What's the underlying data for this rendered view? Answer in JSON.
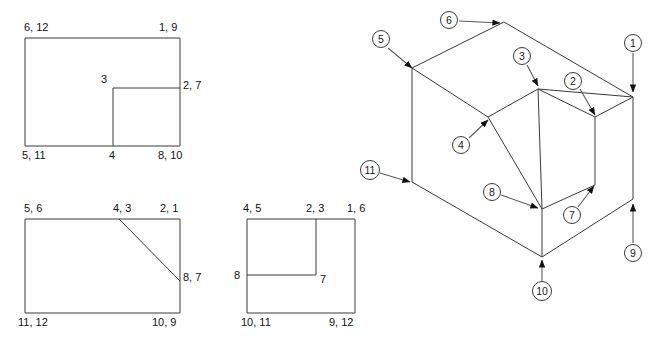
{
  "figure": {
    "type": "engineering-drawing",
    "stroke_color": "#1a1a1a",
    "background": "#ffffff"
  },
  "views": {
    "top_view": {
      "name": "top-view",
      "labels": [
        {
          "id": "tv-l1",
          "text": "6, 12",
          "x": 24,
          "y": 22
        },
        {
          "id": "tv-l2",
          "text": "1, 9",
          "x": 159,
          "y": 22
        },
        {
          "id": "tv-l3",
          "text": "3",
          "x": 101,
          "y": 74
        },
        {
          "id": "tv-l4",
          "text": "2, 7",
          "x": 183,
          "y": 80
        },
        {
          "id": "tv-l5",
          "text": "5, 11",
          "x": 22,
          "y": 150
        },
        {
          "id": "tv-l6",
          "text": "4",
          "x": 109,
          "y": 150
        },
        {
          "id": "tv-l7",
          "text": "8, 10",
          "x": 158,
          "y": 150
        }
      ]
    },
    "front_view": {
      "name": "front-view",
      "labels": [
        {
          "id": "fv-l1",
          "text": "5, 6",
          "x": 24,
          "y": 203
        },
        {
          "id": "fv-l2",
          "text": "4, 3",
          "x": 113,
          "y": 203
        },
        {
          "id": "fv-l3",
          "text": "2, 1",
          "x": 160,
          "y": 203
        },
        {
          "id": "fv-l4",
          "text": "8, 7",
          "x": 183,
          "y": 272
        },
        {
          "id": "fv-l5",
          "text": "11, 12",
          "x": 18,
          "y": 317
        },
        {
          "id": "fv-l6",
          "text": "10, 9",
          "x": 152,
          "y": 317
        }
      ]
    },
    "side_view": {
      "name": "side-view",
      "labels": [
        {
          "id": "sv-l1",
          "text": "4, 5",
          "x": 243,
          "y": 203
        },
        {
          "id": "sv-l2",
          "text": "2, 3",
          "x": 306,
          "y": 203
        },
        {
          "id": "sv-l3",
          "text": "1, 6",
          "x": 347,
          "y": 203
        },
        {
          "id": "sv-l4",
          "text": "8",
          "x": 234,
          "y": 270
        },
        {
          "id": "sv-l5",
          "text": "7",
          "x": 320,
          "y": 274
        },
        {
          "id": "sv-l6",
          "text": "10, 11",
          "x": 241,
          "y": 317
        },
        {
          "id": "sv-l7",
          "text": "9, 12",
          "x": 329,
          "y": 317
        }
      ]
    },
    "isometric_view": {
      "name": "isometric-view",
      "callouts": [
        {
          "id": "c1",
          "number": "1",
          "cx": 633,
          "cy": 43,
          "tip_x": 633,
          "tip_y": 92,
          "from_x": 633,
          "from_y": 53
        },
        {
          "id": "c2",
          "number": "2",
          "cx": 573,
          "cy": 81,
          "tip_x": 595,
          "tip_y": 115,
          "from_x": 580,
          "from_y": 89
        },
        {
          "id": "c3",
          "number": "3",
          "cx": 522,
          "cy": 56,
          "tip_x": 538,
          "tip_y": 86,
          "from_x": 527,
          "from_y": 65
        },
        {
          "id": "c4",
          "number": "4",
          "cx": 461,
          "cy": 145,
          "tip_x": 488,
          "tip_y": 120,
          "from_x": 469,
          "from_y": 138
        },
        {
          "id": "c5",
          "number": "5",
          "cx": 381,
          "cy": 39,
          "tip_x": 412,
          "tip_y": 68,
          "from_x": 388,
          "from_y": 48
        },
        {
          "id": "c6",
          "number": "6",
          "cx": 449,
          "cy": 20,
          "tip_x": 500,
          "tip_y": 23,
          "from_x": 459,
          "from_y": 21
        },
        {
          "id": "c7",
          "number": "7",
          "cx": 572,
          "cy": 215,
          "tip_x": 594,
          "tip_y": 186,
          "from_x": 578,
          "from_y": 207
        },
        {
          "id": "c8",
          "number": "8",
          "cx": 492,
          "cy": 192,
          "tip_x": 538,
          "tip_y": 208,
          "from_x": 501,
          "from_y": 195
        },
        {
          "id": "c9",
          "number": "9",
          "cx": 633,
          "cy": 253,
          "tip_x": 633,
          "tip_y": 204,
          "from_x": 633,
          "from_y": 243
        },
        {
          "id": "c10",
          "number": "10",
          "cx": 542,
          "cy": 291,
          "tip_x": 542,
          "tip_y": 260,
          "from_x": 542,
          "from_y": 281
        },
        {
          "id": "c11",
          "number": "11",
          "cx": 370,
          "cy": 170,
          "tip_x": 410,
          "tip_y": 182,
          "from_x": 380,
          "from_y": 173
        }
      ]
    }
  }
}
